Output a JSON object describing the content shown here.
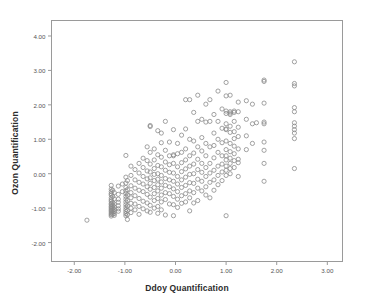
{
  "chart_data": {
    "type": "scatter",
    "title": "",
    "xlabel": "Ddoy Quantification",
    "ylabel": "Ozon Quantification",
    "xlim": [
      -2.45,
      3.3
    ],
    "ylim": [
      -2.55,
      4.45
    ],
    "xticks": [
      -2.0,
      -1.0,
      0.0,
      1.0,
      2.0,
      3.0
    ],
    "xticklabels": [
      "-2.00",
      "-1.00",
      "0.00",
      "1.00",
      "2.00",
      "3.00"
    ],
    "yticks": [
      -2.0,
      -1.0,
      0.0,
      1.0,
      2.0,
      3.0,
      4.0
    ],
    "yticklabels": [
      "-2.00",
      "-1.00",
      "0.00",
      "1.00",
      "2.00",
      "3.00",
      "4.00"
    ],
    "grid": false,
    "legend": null,
    "marker": {
      "shape": "circle-open",
      "size_px": 4.2,
      "stroke": "#8a8a8a",
      "stroke_width": 0.8,
      "fill": "none"
    },
    "frame_color": "#9a9a9a",
    "background": "#ffffff",
    "n_points": 332,
    "points": [
      [
        -1.75,
        -1.35
      ],
      [
        -1.27,
        -0.34
      ],
      [
        -1.27,
        -0.45
      ],
      [
        -1.27,
        -0.52
      ],
      [
        -1.27,
        -0.58
      ],
      [
        -1.27,
        -0.62
      ],
      [
        -1.27,
        -0.7
      ],
      [
        -1.27,
        -0.76
      ],
      [
        -1.27,
        -0.8
      ],
      [
        -1.27,
        -0.86
      ],
      [
        -1.27,
        -0.9
      ],
      [
        -1.27,
        -0.95
      ],
      [
        -1.27,
        -0.99
      ],
      [
        -1.27,
        -1.03
      ],
      [
        -1.27,
        -1.07
      ],
      [
        -1.27,
        -1.11
      ],
      [
        -1.27,
        -1.15
      ],
      [
        -1.27,
        -1.19
      ],
      [
        -1.27,
        -1.23
      ],
      [
        -1.24,
        -0.48
      ],
      [
        -1.24,
        -0.66
      ],
      [
        -1.24,
        -0.84
      ],
      [
        -1.24,
        -0.92
      ],
      [
        -1.24,
        -1.0
      ],
      [
        -1.24,
        -1.06
      ],
      [
        -1.24,
        -1.12
      ],
      [
        -1.24,
        -1.18
      ],
      [
        -1.21,
        -0.55
      ],
      [
        -1.21,
        -0.73
      ],
      [
        -1.21,
        -0.88
      ],
      [
        -1.21,
        -0.97
      ],
      [
        -1.21,
        -1.04
      ],
      [
        -1.21,
        -1.1
      ],
      [
        -1.21,
        -1.16
      ],
      [
        -1.21,
        -1.21
      ],
      [
        -1.13,
        -0.36
      ],
      [
        -1.13,
        -0.6
      ],
      [
        -1.13,
        -0.74
      ],
      [
        -1.13,
        -0.83
      ],
      [
        -1.13,
        -0.93
      ],
      [
        -1.13,
        -1.02
      ],
      [
        -1.13,
        -1.09
      ],
      [
        -1.05,
        -0.3
      ],
      [
        -1.05,
        -0.52
      ],
      [
        -0.98,
        0.53
      ],
      [
        -0.98,
        -0.1
      ],
      [
        -0.98,
        -0.27
      ],
      [
        -0.98,
        -0.4
      ],
      [
        -0.98,
        -0.5
      ],
      [
        -0.98,
        -0.58
      ],
      [
        -0.98,
        -0.66
      ],
      [
        -0.98,
        -0.74
      ],
      [
        -0.98,
        -0.82
      ],
      [
        -0.98,
        -0.9
      ],
      [
        -0.98,
        -0.97
      ],
      [
        -0.98,
        -1.04
      ],
      [
        -0.98,
        -1.1
      ],
      [
        -0.98,
        -1.16
      ],
      [
        -0.98,
        -1.22
      ],
      [
        -0.95,
        -0.2
      ],
      [
        -0.95,
        -0.46
      ],
      [
        -0.95,
        -0.62
      ],
      [
        -0.95,
        -0.78
      ],
      [
        -0.95,
        -0.94
      ],
      [
        -0.95,
        -1.07
      ],
      [
        -0.95,
        -1.19
      ],
      [
        -0.95,
        -1.33
      ],
      [
        -0.88,
        0.22
      ],
      [
        -0.88,
        -0.05
      ],
      [
        -0.88,
        -0.35
      ],
      [
        -0.88,
        -0.55
      ],
      [
        -0.88,
        -0.7
      ],
      [
        -0.88,
        -0.86
      ],
      [
        -0.88,
        -1.0
      ],
      [
        -0.88,
        -1.13
      ],
      [
        -0.8,
        0.12
      ],
      [
        -0.8,
        -0.18
      ],
      [
        -0.8,
        -0.42
      ],
      [
        -0.8,
        -0.64
      ],
      [
        -0.8,
        -0.88
      ],
      [
        -0.8,
        -1.05
      ],
      [
        -0.72,
        0.3
      ],
      [
        -0.72,
        0.02
      ],
      [
        -0.72,
        -0.25
      ],
      [
        -0.72,
        -0.48
      ],
      [
        -0.72,
        -0.72
      ],
      [
        -0.72,
        -0.95
      ],
      [
        -0.72,
        -1.18
      ],
      [
        -0.64,
        0.45
      ],
      [
        -0.64,
        0.18
      ],
      [
        -0.64,
        -0.08
      ],
      [
        -0.64,
        -0.3
      ],
      [
        -0.64,
        -0.52
      ],
      [
        -0.64,
        -0.8
      ],
      [
        -0.64,
        -1.02
      ],
      [
        -0.56,
        0.78
      ],
      [
        -0.56,
        0.38
      ],
      [
        -0.56,
        0.08
      ],
      [
        -0.56,
        -0.15
      ],
      [
        -0.56,
        -0.38
      ],
      [
        -0.56,
        -0.6
      ],
      [
        -0.56,
        -0.85
      ],
      [
        -0.56,
        -1.08
      ],
      [
        -0.5,
        1.4
      ],
      [
        -0.5,
        1.37
      ],
      [
        -0.5,
        0.62
      ],
      [
        -0.5,
        0.28
      ],
      [
        -0.5,
        0.05
      ],
      [
        -0.5,
        -0.12
      ],
      [
        -0.5,
        -0.28
      ],
      [
        -0.5,
        -0.45
      ],
      [
        -0.5,
        -0.68
      ],
      [
        -0.5,
        -0.92
      ],
      [
        -0.5,
        -1.12
      ],
      [
        -0.42,
        0.72
      ],
      [
        -0.42,
        0.4
      ],
      [
        -0.42,
        0.15
      ],
      [
        -0.42,
        -0.02
      ],
      [
        -0.42,
        -0.2
      ],
      [
        -0.42,
        -0.4
      ],
      [
        -0.42,
        -0.58
      ],
      [
        -0.42,
        -0.78
      ],
      [
        -0.42,
        -1.0
      ],
      [
        -0.35,
        1.25
      ],
      [
        -0.35,
        0.55
      ],
      [
        -0.35,
        0.24
      ],
      [
        -0.35,
        0.0
      ],
      [
        -0.35,
        -0.16
      ],
      [
        -0.35,
        -0.32
      ],
      [
        -0.35,
        -0.5
      ],
      [
        -0.35,
        -0.72
      ],
      [
        -0.35,
        -0.95
      ],
      [
        -0.35,
        -1.15
      ],
      [
        -0.28,
        1.18
      ],
      [
        -0.28,
        0.9
      ],
      [
        -0.28,
        0.48
      ],
      [
        -0.28,
        0.2
      ],
      [
        -0.28,
        -0.05
      ],
      [
        -0.28,
        -0.24
      ],
      [
        -0.28,
        -0.42
      ],
      [
        -0.28,
        -0.62
      ],
      [
        -0.28,
        -0.82
      ],
      [
        -0.28,
        -1.05
      ],
      [
        -0.2,
        1.52
      ],
      [
        -0.2,
        0.68
      ],
      [
        -0.2,
        0.34
      ],
      [
        -0.2,
        0.1
      ],
      [
        -0.2,
        -0.14
      ],
      [
        -0.2,
        -0.34
      ],
      [
        -0.2,
        -0.55
      ],
      [
        -0.2,
        -0.75
      ],
      [
        -0.2,
        -1.2
      ],
      [
        -0.12,
        0.92
      ],
      [
        -0.12,
        0.52
      ],
      [
        -0.12,
        0.26
      ],
      [
        -0.12,
        0.04
      ],
      [
        -0.12,
        -0.18
      ],
      [
        -0.12,
        -0.38
      ],
      [
        -0.12,
        -0.58
      ],
      [
        -0.12,
        -0.88
      ],
      [
        -0.04,
        1.28
      ],
      [
        -0.04,
        0.55
      ],
      [
        -0.04,
        0.52
      ],
      [
        -0.04,
        0.3
      ],
      [
        -0.04,
        0.02
      ],
      [
        -0.04,
        -0.22
      ],
      [
        -0.04,
        -0.44
      ],
      [
        -0.04,
        -0.66
      ],
      [
        -0.04,
        -0.9
      ],
      [
        -0.04,
        -1.22
      ],
      [
        0.04,
        0.88
      ],
      [
        0.04,
        0.58
      ],
      [
        0.04,
        0.2
      ],
      [
        0.04,
        -0.08
      ],
      [
        0.04,
        -0.3
      ],
      [
        0.04,
        -0.52
      ],
      [
        0.04,
        -0.74
      ],
      [
        0.04,
        -0.98
      ],
      [
        0.12,
        1.12
      ],
      [
        0.12,
        0.62
      ],
      [
        0.12,
        0.32
      ],
      [
        0.12,
        0.06
      ],
      [
        0.12,
        -0.18
      ],
      [
        0.12,
        -0.4
      ],
      [
        0.12,
        -0.64
      ],
      [
        0.12,
        -0.86
      ],
      [
        0.2,
        2.15
      ],
      [
        0.2,
        1.3
      ],
      [
        0.2,
        0.72
      ],
      [
        0.2,
        0.4
      ],
      [
        0.2,
        0.14
      ],
      [
        0.2,
        -0.1
      ],
      [
        0.2,
        -0.34
      ],
      [
        0.2,
        -0.58
      ],
      [
        0.2,
        -0.82
      ],
      [
        0.28,
        2.15
      ],
      [
        0.28,
        1.0
      ],
      [
        0.28,
        0.52
      ],
      [
        0.28,
        0.22
      ],
      [
        0.28,
        -0.02
      ],
      [
        0.28,
        -0.26
      ],
      [
        0.28,
        -0.5
      ],
      [
        0.28,
        -0.7
      ],
      [
        0.28,
        -1.08
      ],
      [
        0.36,
        1.78
      ],
      [
        0.36,
        0.95
      ],
      [
        0.36,
        0.6
      ],
      [
        0.36,
        0.28
      ],
      [
        0.36,
        0.0
      ],
      [
        0.36,
        -0.28
      ],
      [
        0.36,
        -0.55
      ],
      [
        0.36,
        -0.85
      ],
      [
        0.44,
        2.28
      ],
      [
        0.44,
        1.52
      ],
      [
        0.44,
        0.78
      ],
      [
        0.44,
        0.42
      ],
      [
        0.44,
        0.12
      ],
      [
        0.44,
        -0.16
      ],
      [
        0.44,
        -0.42
      ],
      [
        0.44,
        -0.78
      ],
      [
        0.52,
        1.58
      ],
      [
        0.52,
        1.05
      ],
      [
        0.52,
        0.66
      ],
      [
        0.52,
        0.3
      ],
      [
        0.52,
        0.04
      ],
      [
        0.52,
        -0.22
      ],
      [
        0.52,
        -0.5
      ],
      [
        0.6,
        2.02
      ],
      [
        0.6,
        1.5
      ],
      [
        0.6,
        0.88
      ],
      [
        0.6,
        0.52
      ],
      [
        0.6,
        0.18
      ],
      [
        0.6,
        -0.08
      ],
      [
        0.6,
        -0.38
      ],
      [
        0.6,
        -0.62
      ],
      [
        0.68,
        2.15
      ],
      [
        0.68,
        1.52
      ],
      [
        0.68,
        0.78
      ],
      [
        0.68,
        0.3
      ],
      [
        0.68,
        0.02
      ],
      [
        0.68,
        -0.25
      ],
      [
        0.68,
        -0.7
      ],
      [
        0.76,
        1.72
      ],
      [
        0.76,
        1.18
      ],
      [
        0.76,
        0.82
      ],
      [
        0.76,
        0.46
      ],
      [
        0.76,
        0.1
      ],
      [
        0.76,
        -0.18
      ],
      [
        0.76,
        -0.48
      ],
      [
        0.84,
        2.4
      ],
      [
        0.84,
        1.52
      ],
      [
        0.84,
        1.0
      ],
      [
        0.84,
        0.62
      ],
      [
        0.84,
        0.22
      ],
      [
        0.84,
        -0.05
      ],
      [
        0.84,
        -0.32
      ],
      [
        0.92,
        1.88
      ],
      [
        0.92,
        1.32
      ],
      [
        0.92,
        0.9
      ],
      [
        0.92,
        0.52
      ],
      [
        0.92,
        0.28
      ],
      [
        0.92,
        0.05
      ],
      [
        0.92,
        -0.2
      ],
      [
        1.0,
        2.65
      ],
      [
        1.0,
        2.26
      ],
      [
        1.0,
        1.82
      ],
      [
        1.0,
        1.75
      ],
      [
        1.0,
        1.45
      ],
      [
        1.0,
        1.3
      ],
      [
        1.0,
        1.28
      ],
      [
        1.0,
        0.95
      ],
      [
        1.0,
        0.7
      ],
      [
        1.0,
        0.52
      ],
      [
        1.0,
        0.4
      ],
      [
        1.0,
        0.22
      ],
      [
        1.0,
        0.1
      ],
      [
        1.0,
        -0.05
      ],
      [
        1.0,
        -1.22
      ],
      [
        1.08,
        2.28
      ],
      [
        1.08,
        1.8
      ],
      [
        1.08,
        1.76
      ],
      [
        1.08,
        1.72
      ],
      [
        1.08,
        1.38
      ],
      [
        1.08,
        1.2
      ],
      [
        1.08,
        0.88
      ],
      [
        1.08,
        0.64
      ],
      [
        1.08,
        0.45
      ],
      [
        1.08,
        0.3
      ],
      [
        1.08,
        0.15
      ],
      [
        1.08,
        0.0
      ],
      [
        1.16,
        1.82
      ],
      [
        1.16,
        1.78
      ],
      [
        1.16,
        1.52
      ],
      [
        1.16,
        1.22
      ],
      [
        1.16,
        1.02
      ],
      [
        1.16,
        0.8
      ],
      [
        1.16,
        0.58
      ],
      [
        1.16,
        0.38
      ],
      [
        1.16,
        0.18
      ],
      [
        1.24,
        2.08
      ],
      [
        1.24,
        1.8
      ],
      [
        1.24,
        1.35
      ],
      [
        1.24,
        1.08
      ],
      [
        1.24,
        0.72
      ],
      [
        1.24,
        0.42
      ],
      [
        1.24,
        0.32
      ],
      [
        1.24,
        -0.08
      ],
      [
        1.4,
        2.12
      ],
      [
        1.4,
        1.58
      ],
      [
        1.4,
        1.1
      ],
      [
        1.4,
        0.7
      ],
      [
        1.52,
        2.02
      ],
      [
        1.52,
        1.45
      ],
      [
        1.52,
        0.88
      ],
      [
        1.6,
        1.48
      ],
      [
        1.75,
        2.72
      ],
      [
        1.75,
        2.68
      ],
      [
        1.75,
        2.05
      ],
      [
        1.75,
        1.5
      ],
      [
        1.75,
        1.45
      ],
      [
        1.75,
        0.92
      ],
      [
        1.75,
        0.68
      ],
      [
        1.75,
        0.3
      ],
      [
        1.75,
        -0.22
      ],
      [
        2.35,
        3.25
      ],
      [
        2.35,
        2.62
      ],
      [
        2.35,
        2.55
      ],
      [
        2.35,
        1.92
      ],
      [
        2.35,
        1.8
      ],
      [
        2.35,
        1.48
      ],
      [
        2.35,
        1.38
      ],
      [
        2.35,
        1.28
      ],
      [
        2.35,
        1.18
      ],
      [
        2.35,
        1.02
      ],
      [
        2.35,
        0.15
      ]
    ]
  }
}
